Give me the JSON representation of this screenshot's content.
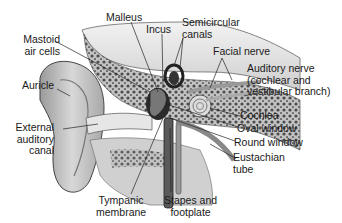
{
  "diagram": {
    "labels": [
      {
        "id": "malleus",
        "lines": [
          "Malleus"
        ]
      },
      {
        "id": "incus",
        "lines": [
          "Incus"
        ]
      },
      {
        "id": "semicircular-canals",
        "lines": [
          "Semicircular",
          "canals"
        ]
      },
      {
        "id": "mastoid-air-cells",
        "lines": [
          "Mastoid",
          "air cells"
        ]
      },
      {
        "id": "facial-nerve",
        "lines": [
          "Facial nerve"
        ]
      },
      {
        "id": "auditory-nerve",
        "lines": [
          "Auditory nerve",
          "(cochlear and",
          "vestibular branch)"
        ]
      },
      {
        "id": "auricle",
        "lines": [
          "Auricle"
        ]
      },
      {
        "id": "cochlea",
        "lines": [
          "Cochlea"
        ]
      },
      {
        "id": "external-auditory-canal",
        "lines": [
          "External",
          "auditory",
          "canal"
        ]
      },
      {
        "id": "oval-window",
        "lines": [
          "Oval window"
        ]
      },
      {
        "id": "round-window",
        "lines": [
          "Round window"
        ]
      },
      {
        "id": "eustachian-tube",
        "lines": [
          "Eustachian",
          "tube"
        ]
      },
      {
        "id": "tympanic-membrane",
        "lines": [
          "Tympanic",
          "membrane"
        ]
      },
      {
        "id": "stapes-and-footplate",
        "lines": [
          "Stapes and",
          "footplate"
        ]
      }
    ]
  }
}
